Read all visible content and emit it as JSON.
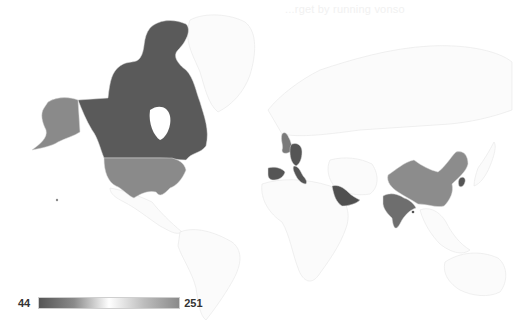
{
  "title_ghost": "...rget by running vonso",
  "legend": {
    "min_label": "44",
    "max_label": "251",
    "gradient": [
      "#555555",
      "#ffffff",
      "#8a8a8a"
    ]
  },
  "colors": {
    "background": "#ffffff",
    "unshaded_land": "#fbfbfb",
    "border": "#e0e0e0"
  },
  "regions": [
    {
      "name": "Canada",
      "fill": "#5a5a5a"
    },
    {
      "name": "United States",
      "fill": "#8a8a8a"
    },
    {
      "name": "United Kingdom",
      "fill": "#7a7a7a"
    },
    {
      "name": "Germany",
      "fill": "#555555"
    },
    {
      "name": "Italy",
      "fill": "#555555"
    },
    {
      "name": "Spain",
      "fill": "#555555"
    },
    {
      "name": "Saudi Arabia",
      "fill": "#505050"
    },
    {
      "name": "India",
      "fill": "#6e6e6e"
    },
    {
      "name": "China",
      "fill": "#8c8c8c"
    },
    {
      "name": "South Korea",
      "fill": "#555555"
    },
    {
      "name": "Sri Lanka",
      "fill": "#555555"
    }
  ]
}
